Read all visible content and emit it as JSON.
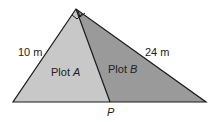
{
  "diagram": {
    "type": "right-triangle-partition",
    "side_left_label": "10 m",
    "side_right_label": "24 m",
    "region_a": {
      "prefix": "Plot ",
      "var": "A"
    },
    "region_b": {
      "prefix": "Plot ",
      "var": "B"
    },
    "point_label": "P",
    "colors": {
      "plot_a_fill": "#c8c8c8",
      "plot_b_fill": "#9a9a9a",
      "stroke": "#1a1a1a"
    }
  }
}
